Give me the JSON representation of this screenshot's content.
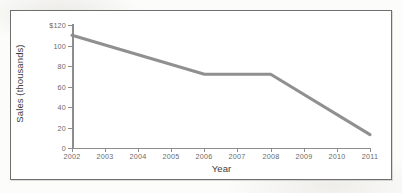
{
  "chart_data": {
    "type": "line",
    "title": "",
    "xlabel": "Year",
    "ylabel": "Sales (thousands)",
    "x": [
      2002,
      2003,
      2004,
      2005,
      2006,
      2007,
      2008,
      2009,
      2010,
      2011
    ],
    "categories": [
      "2002",
      "2003",
      "2004",
      "2005",
      "2006",
      "2007",
      "2008",
      "2009",
      "2010",
      "2011"
    ],
    "series": [
      {
        "name": "Sales",
        "color": "#8a8a8a",
        "values": [
          110,
          100,
          90,
          81,
          72,
          72,
          72,
          52,
          32,
          13
        ]
      }
    ],
    "vertices": [
      {
        "x": 2002,
        "y": 110
      },
      {
        "x": 2006,
        "y": 72
      },
      {
        "x": 2008,
        "y": 72
      },
      {
        "x": 2011,
        "y": 13
      }
    ],
    "xlim": [
      2002,
      2011
    ],
    "ylim": [
      0,
      120
    ],
    "yticks": [
      0,
      20,
      40,
      60,
      80,
      100,
      120
    ],
    "ytick_labels": [
      "0",
      "20",
      "40",
      "60",
      "80",
      "100",
      "$120"
    ],
    "xtick_labels": [
      "2002",
      "2003",
      "2004",
      "2005",
      "2006",
      "2007",
      "2008",
      "2009",
      "2010",
      "2011"
    ],
    "grid": false,
    "legend": "none"
  },
  "axes": {
    "y_title": "Sales (thousands)",
    "x_title": "Year",
    "y_ticks": [
      {
        "value": 120,
        "label": "$120",
        "top": 25
      },
      {
        "value": 100,
        "label": "100",
        "top": 45.5
      },
      {
        "value": 80,
        "label": "80",
        "top": 66
      },
      {
        "value": 60,
        "label": "60",
        "top": 86.5
      },
      {
        "value": 40,
        "label": "40",
        "top": 107
      },
      {
        "value": 20,
        "label": "20",
        "top": 127.5
      },
      {
        "value": 0,
        "label": "0",
        "top": 148
      }
    ],
    "x_ticks": [
      {
        "label": "2002",
        "left": 72
      },
      {
        "label": "2003",
        "left": 105
      },
      {
        "label": "2004",
        "left": 138
      },
      {
        "label": "2005",
        "left": 171
      },
      {
        "label": "2006",
        "left": 204
      },
      {
        "label": "2007",
        "left": 237
      },
      {
        "label": "2008",
        "left": 271
      },
      {
        "label": "2009",
        "left": 304
      },
      {
        "label": "2010",
        "left": 337
      },
      {
        "label": "2011",
        "left": 370
      }
    ]
  },
  "style": {
    "line_color": "#8a8a8a",
    "axis_color": "#8d8d8d",
    "frame_color": "#6f6f6f",
    "text_color": "#3d3d3d",
    "tick_text_color": "#6a6a6a",
    "paper_color": "#fcfcfa"
  },
  "series_path": "M 72,35.2 L 204,75.8 L 271,75.8 L 370,134.7"
}
